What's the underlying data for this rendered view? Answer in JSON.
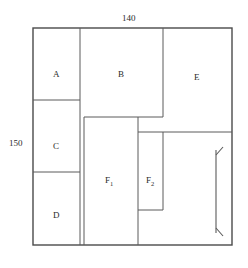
{
  "figure": {
    "type": "floor-plan-partition-diagram",
    "outer_rect": {
      "x": 33,
      "y": 28,
      "width": 199,
      "height": 217
    },
    "dimensions": {
      "top_label": "140",
      "left_label": "150",
      "right_arrow_label": ""
    },
    "regions": [
      {
        "id": "A",
        "label": "A",
        "base": "A",
        "sub": "",
        "x": 33,
        "y": 28,
        "width": 47,
        "height": 72
      },
      {
        "id": "C",
        "label": "C",
        "base": "C",
        "sub": "",
        "x": 33,
        "y": 100,
        "width": 47,
        "height": 72
      },
      {
        "id": "D",
        "label": "D",
        "base": "D",
        "sub": "",
        "x": 33,
        "y": 172,
        "width": 47,
        "height": 73
      },
      {
        "id": "B",
        "label": "B",
        "base": "B",
        "sub": "",
        "x": 80,
        "y": 28,
        "width": 83,
        "height": 89
      },
      {
        "id": "E",
        "label": "E",
        "base": "E",
        "sub": "",
        "x": 163,
        "y": 28,
        "width": 69,
        "height": 104
      },
      {
        "id": "F1",
        "label": "F1",
        "base": "F",
        "sub": "1",
        "x": 84,
        "y": 117,
        "width": 54,
        "height": 128
      },
      {
        "id": "F2",
        "label": "F2",
        "base": "F",
        "sub": "2",
        "x": 138,
        "y": 132,
        "width": 25,
        "height": 78
      }
    ],
    "arrow": {
      "name": "vertical-dimension-arrow",
      "x": 216,
      "y_top": 150,
      "y_bottom": 233,
      "double_headed": true
    },
    "colors": {
      "line": "#4a4a4a",
      "outer_line": "#3a3a3a",
      "text": "#2b2b2b",
      "background": "#ffffff"
    }
  }
}
